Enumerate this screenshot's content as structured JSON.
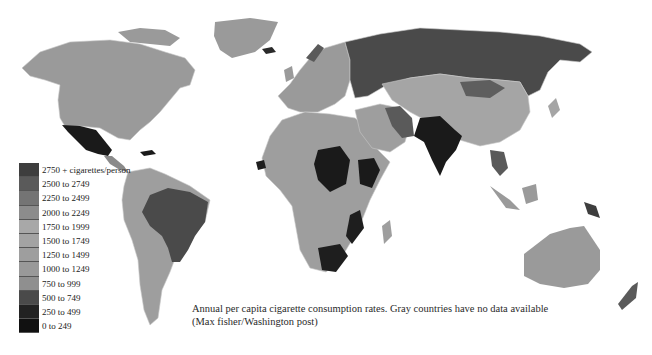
{
  "figure": {
    "type": "choropleth-map",
    "title": "Annual per capita cigarette consumption rates",
    "caption": "Annual per capita cigarette consumption rates. Gray countries have no data available (Max fisher/Washington post)"
  },
  "legend": {
    "items": [
      {
        "label": "2750 + cigarettes/person",
        "color": "#3e3e3e"
      },
      {
        "label": "2500 to 2749",
        "color": "#5a5a5a"
      },
      {
        "label": "2250 to 2499",
        "color": "#747474"
      },
      {
        "label": "2000 to 2249",
        "color": "#8c8c8c"
      },
      {
        "label": "1750 to 1999",
        "color": "#a8a8a8"
      },
      {
        "label": "1500 to 1749",
        "color": "#a3a3a3"
      },
      {
        "label": "1250 to 1499",
        "color": "#9e9e9e"
      },
      {
        "label": "1000 to 1249",
        "color": "#999999"
      },
      {
        "label": "750 to 999",
        "color": "#8f8f8f"
      },
      {
        "label": "500 to 749",
        "color": "#4a4a4a"
      },
      {
        "label": "250 to 499",
        "color": "#222222"
      },
      {
        "label": "0 to 249",
        "color": "#111111"
      }
    ]
  },
  "regions": [
    {
      "name": "North America (USA/Canada)",
      "shade": "#9a9a9a"
    },
    {
      "name": "Greenland",
      "shade": "#9a9a9a"
    },
    {
      "name": "Mexico",
      "shade": "#1a1a1a"
    },
    {
      "name": "Central America",
      "shade": "#8a8a8a"
    },
    {
      "name": "South America",
      "shade": "#9e9e9e"
    },
    {
      "name": "Brazil",
      "shade": "#4a4a4a"
    },
    {
      "name": "Europe",
      "shade": "#9a9a9a"
    },
    {
      "name": "Russia",
      "shade": "#4a4a4a"
    },
    {
      "name": "Africa",
      "shade": "#9e9e9e"
    },
    {
      "name": "Central Africa",
      "shade": "#1a1a1a"
    },
    {
      "name": "South Africa",
      "shade": "#1e1e1e"
    },
    {
      "name": "Middle East",
      "shade": "#9e9e9e"
    },
    {
      "name": "Iran",
      "shade": "#5a5a5a"
    },
    {
      "name": "China/Central Asia",
      "shade": "#a5a5a5"
    },
    {
      "name": "Mongolia",
      "shade": "#5e5e5e"
    },
    {
      "name": "India",
      "shade": "#1a1a1a"
    },
    {
      "name": "Southeast Asia",
      "shade": "#5a5a5a"
    },
    {
      "name": "Indonesia",
      "shade": "#9a9a9a"
    },
    {
      "name": "Australia",
      "shade": "#9a9a9a"
    }
  ]
}
